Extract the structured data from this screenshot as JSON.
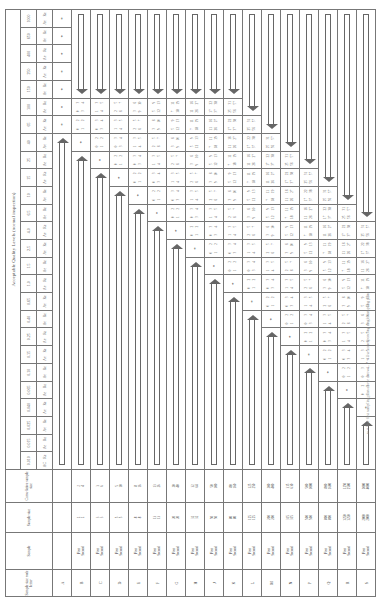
{
  "table": {
    "title": "Acceptable Quality Levels (normal inspection)",
    "headers": {
      "code_letter": "Sample size code letter",
      "sample": "Sample",
      "sample_size": "Sample size",
      "cumulative": "Cumu-lative sample size",
      "ac": "Ac",
      "re": "Re"
    },
    "aql_values": [
      "0.010",
      "0.015",
      "0.025",
      "0.040",
      "0.065",
      "0.10",
      "0.15",
      "0.25",
      "0.40",
      "0.65",
      "1.0",
      "1.5",
      "2.5",
      "4.0",
      "6.5",
      "10",
      "15",
      "25",
      "40",
      "65",
      "100",
      "150",
      "250",
      "400",
      "650",
      "1000"
    ],
    "rows": [
      {
        "code": "A",
        "sample": [
          "",
          ""
        ],
        "size": [
          "",
          ""
        ],
        "cum": [
          "",
          ""
        ]
      },
      {
        "code": "B",
        "sample": [
          "First",
          "Second"
        ],
        "size": [
          "2",
          "2"
        ],
        "cum": [
          "2",
          "4"
        ]
      },
      {
        "code": "C",
        "sample": [
          "First",
          "Second"
        ],
        "size": [
          "3",
          "3"
        ],
        "cum": [
          "3",
          "6"
        ]
      },
      {
        "code": "D",
        "sample": [
          "First",
          "Second"
        ],
        "size": [
          "5",
          "5"
        ],
        "cum": [
          "5",
          "10"
        ]
      },
      {
        "code": "E",
        "sample": [
          "First",
          "Second"
        ],
        "size": [
          "8",
          "8"
        ],
        "cum": [
          "8",
          "16"
        ]
      },
      {
        "code": "F",
        "sample": [
          "First",
          "Second"
        ],
        "size": [
          "13",
          "13"
        ],
        "cum": [
          "13",
          "26"
        ]
      },
      {
        "code": "G",
        "sample": [
          "First",
          "Second"
        ],
        "size": [
          "20",
          "20"
        ],
        "cum": [
          "20",
          "40"
        ]
      },
      {
        "code": "H",
        "sample": [
          "First",
          "Second"
        ],
        "size": [
          "32",
          "32"
        ],
        "cum": [
          "32",
          "64"
        ]
      },
      {
        "code": "J",
        "sample": [
          "First",
          "Second"
        ],
        "size": [
          "50",
          "50"
        ],
        "cum": [
          "50",
          "100"
        ]
      },
      {
        "code": "K",
        "sample": [
          "First",
          "Second"
        ],
        "size": [
          "80",
          "80"
        ],
        "cum": [
          "80",
          "160"
        ]
      },
      {
        "code": "L",
        "sample": [
          "First",
          "Second"
        ],
        "size": [
          "125",
          "125"
        ],
        "cum": [
          "125",
          "250"
        ]
      },
      {
        "code": "M",
        "sample": [
          "First",
          "Second"
        ],
        "size": [
          "200",
          "200"
        ],
        "cum": [
          "200",
          "400"
        ]
      },
      {
        "code": "N",
        "sample": [
          "First",
          "Second"
        ],
        "size": [
          "315",
          "315"
        ],
        "cum": [
          "315",
          "630"
        ]
      },
      {
        "code": "P",
        "sample": [
          "First",
          "Second"
        ],
        "size": [
          "500",
          "500"
        ],
        "cum": [
          "500",
          "1000"
        ]
      },
      {
        "code": "Q",
        "sample": [
          "First",
          "Second"
        ],
        "size": [
          "800",
          "800"
        ],
        "cum": [
          "800",
          "1600"
        ]
      },
      {
        "code": "R",
        "sample": [
          "First",
          "Second"
        ],
        "size": [
          "1250",
          "1250"
        ],
        "cum": [
          "1250",
          "2500"
        ]
      },
      {
        "code": "S",
        "sample": [
          "First",
          "Second"
        ],
        "size": [
          "2000",
          "2000"
        ],
        "cum": [
          "2000",
          "4000"
        ]
      }
    ],
    "plans": [
      [
        "0 2",
        "1 2"
      ],
      [
        "0 3",
        "3 4"
      ],
      [
        "1 3",
        "4 5"
      ],
      [
        "2 5",
        "6 7"
      ],
      [
        "3 6",
        "9 10"
      ],
      [
        "5 9",
        "12 13"
      ],
      [
        "7 11",
        "18 19"
      ],
      [
        "11 16",
        "26 27"
      ],
      [
        "17 22",
        "37 38"
      ],
      [
        "25 31",
        "56 57"
      ]
    ],
    "symbols": {
      "star": "*",
      "up_arrow": "⇧",
      "right_arrow": "⇨",
      "left_arrow": "⇦"
    }
  },
  "footnote": "⇦ = Use first sampling plan above arrow ... * = Use corresponding single sampling plan"
}
